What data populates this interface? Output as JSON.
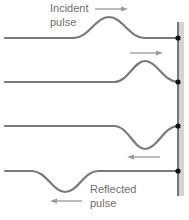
{
  "labels": {
    "incident_line1": "Incident",
    "incident_line2": "pulse",
    "reflected_line1": "Reflected",
    "reflected_line2": "pulse"
  },
  "colors": {
    "string": "#7a7a7a",
    "arrow": "#9a9a9a",
    "wall": "#5a5a5a",
    "wall_shade": "#d4d4d4",
    "attachment_point": "#111111",
    "text": "#6e6e6e"
  },
  "diagram": {
    "frames": [
      {
        "index": 1,
        "pulse": "upright",
        "direction": "right",
        "position": "approaching wall"
      },
      {
        "index": 2,
        "pulse": "upright",
        "direction": "right",
        "position": "reaching wall"
      },
      {
        "index": 3,
        "pulse": "inverted",
        "direction": "left",
        "position": "leaving wall"
      },
      {
        "index": 4,
        "pulse": "inverted",
        "direction": "left",
        "position": "reflected away from wall"
      }
    ],
    "boundary": "fixed end (wall)"
  }
}
